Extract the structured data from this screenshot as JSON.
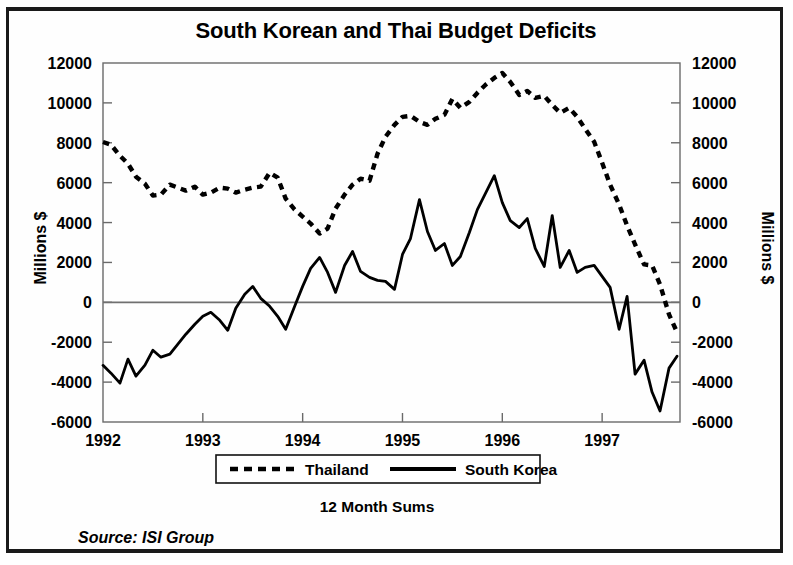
{
  "chart_data": {
    "type": "line",
    "title": "South Korean and Thai Budget Deficits",
    "xlabel": "12 Month Sums",
    "ylabel": "Millions $",
    "ylabel_right": "Millions $",
    "source": "Source: ISI Group",
    "grid": false,
    "zero_line": true,
    "legend_position": "bottom",
    "ylim": [
      -6000,
      12000
    ],
    "ytick_step": 2000,
    "yticks": [
      12000,
      10000,
      8000,
      6000,
      4000,
      2000,
      0,
      -2000,
      -4000,
      -6000
    ],
    "ytick_labels": [
      "12000",
      "10000",
      "8000",
      "6000",
      "4000",
      "2000",
      "0",
      "-2000",
      "-4000",
      "-6000"
    ],
    "xlim": [
      1992.0,
      1997.78
    ],
    "xticks": [
      1992,
      1993,
      1994,
      1995,
      1996,
      1997
    ],
    "xtick_labels": [
      "1992",
      "1993",
      "1994",
      "1995",
      "1996",
      "1997"
    ],
    "x": [
      1992.0,
      1992.08,
      1992.17,
      1992.25,
      1992.33,
      1992.42,
      1992.5,
      1992.58,
      1992.67,
      1992.75,
      1992.83,
      1992.92,
      1993.0,
      1993.08,
      1993.17,
      1993.25,
      1993.33,
      1993.42,
      1993.5,
      1993.58,
      1993.67,
      1993.75,
      1993.83,
      1993.92,
      1994.0,
      1994.08,
      1994.17,
      1994.25,
      1994.33,
      1994.42,
      1994.5,
      1994.58,
      1994.67,
      1994.75,
      1994.83,
      1994.92,
      1995.0,
      1995.08,
      1995.17,
      1995.25,
      1995.33,
      1995.42,
      1995.5,
      1995.58,
      1995.67,
      1995.75,
      1995.83,
      1995.92,
      1996.0,
      1996.08,
      1996.17,
      1996.25,
      1996.33,
      1996.42,
      1996.5,
      1996.58,
      1996.67,
      1996.75,
      1996.83,
      1996.92,
      1997.0,
      1997.08,
      1997.17,
      1997.25,
      1997.33,
      1997.42,
      1997.5,
      1997.58,
      1997.67,
      1997.75
    ],
    "series": [
      {
        "name": "Thailand",
        "style": "dashed",
        "color": "#000000",
        "values": [
          8040,
          7900,
          7350,
          6950,
          6300,
          5950,
          5350,
          5400,
          5900,
          5750,
          5600,
          5800,
          5400,
          5500,
          5750,
          5700,
          5500,
          5650,
          5750,
          5800,
          6500,
          6250,
          5200,
          4650,
          4300,
          3950,
          3450,
          3700,
          4700,
          5400,
          5900,
          6200,
          6100,
          7450,
          8300,
          8900,
          9300,
          9350,
          9050,
          8900,
          9200,
          9400,
          10200,
          9750,
          10050,
          10500,
          10900,
          11250,
          11500,
          11050,
          10400,
          10600,
          10250,
          10350,
          9900,
          9500,
          9750,
          9300,
          8700,
          8050,
          7000,
          5900,
          4900,
          3850,
          2900,
          1900,
          1850,
          900,
          -600,
          -1500
        ]
      },
      {
        "name": "South Korea",
        "style": "solid",
        "color": "#000000",
        "values": [
          -3160,
          -3550,
          -4050,
          -2850,
          -3700,
          -3150,
          -2400,
          -2750,
          -2600,
          -2100,
          -1600,
          -1100,
          -700,
          -500,
          -900,
          -1400,
          -300,
          400,
          800,
          200,
          -200,
          -700,
          -1350,
          -200,
          800,
          1700,
          2250,
          1500,
          500,
          1850,
          2550,
          1550,
          1250,
          1100,
          1050,
          650,
          2400,
          3200,
          5150,
          3550,
          2600,
          2950,
          1850,
          2300,
          3500,
          4650,
          5450,
          6350,
          5000,
          4100,
          3750,
          4200,
          2700,
          1800,
          4350,
          1750,
          2600,
          1500,
          1750,
          1850,
          1300,
          750,
          -1350,
          300,
          -3600,
          -2900,
          -4500,
          -5450,
          -3300,
          -2700
        ]
      }
    ],
    "annotations": {
      "thailand_peak": {
        "x": 1996.0,
        "y": 11500
      },
      "korea_peak": {
        "x": 1995.92,
        "y": 6350
      },
      "korea_trough": {
        "x": 1997.58,
        "y": -5450
      }
    }
  },
  "legend": {
    "items": [
      {
        "label": "Thailand",
        "style": "dashed"
      },
      {
        "label": "South Korea",
        "style": "solid"
      }
    ]
  },
  "colors": {
    "ink": "#000000",
    "frame": "#1a1a1a",
    "axis": "#555555",
    "background": "#ffffff"
  }
}
